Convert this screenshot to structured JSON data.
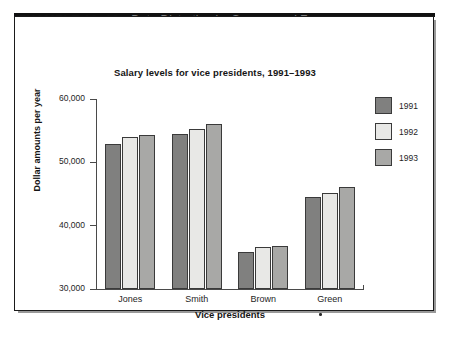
{
  "header": {
    "example_label": "EXAMPLE 10–18",
    "caption": "Data Distortion by Suppressed Zero"
  },
  "colors": {
    "series_1991": "#80807f",
    "series_1992": "#e8e8e6",
    "series_1993": "#a8a8a6",
    "bar_outline": "#3a3a3a",
    "axis": "#4a4a4a",
    "caption_gray": "#7d7d7d",
    "text": "#151515",
    "frame": "#1a1a1a"
  },
  "axis_titles": {
    "x": "Vice presidents",
    "y": "Dollar amounts per year"
  },
  "marks": {
    "green_footnote_dot": "•"
  },
  "chart_data": {
    "type": "bar",
    "title": "Salary levels for vice presidents, 1991–1993",
    "xlabel": "Vice presidents",
    "ylabel": "Dollar amounts per year",
    "categories": [
      "Jones",
      "Smith",
      "Brown",
      "Green"
    ],
    "series": [
      {
        "name": "1991",
        "color": "#80807f",
        "values": [
          52900,
          54500,
          35850,
          44500
        ]
      },
      {
        "name": "1992",
        "color": "#e8e8e6",
        "values": [
          54000,
          55300,
          36600,
          45150
        ]
      },
      {
        "name": "1993",
        "color": "#a8a8a6",
        "values": [
          54300,
          56050,
          36800,
          46100
        ]
      }
    ],
    "ylim": [
      30000,
      60000
    ],
    "yticks": [
      30000,
      40000,
      50000,
      60000
    ],
    "ytick_labels": [
      "30,000",
      "40,000",
      "50,000",
      "60,000"
    ],
    "grid": false,
    "legend_position": "right"
  }
}
